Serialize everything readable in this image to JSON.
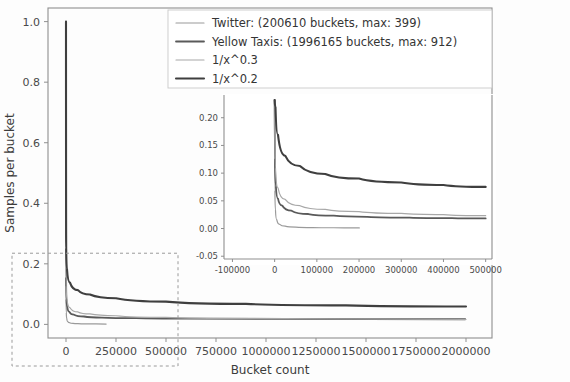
{
  "chart_data": {
    "type": "line",
    "title": "",
    "xlabel": "Bucket count",
    "ylabel": "Samples per bucket",
    "xlim": [
      -90000,
      2130000
    ],
    "ylim": [
      -0.045,
      1.045
    ],
    "grid": false,
    "legend_position": "upper center",
    "xticks": [
      0,
      250000,
      500000,
      750000,
      1000000,
      1250000,
      1500000,
      1750000,
      2000000
    ],
    "xticklabels": [
      "0",
      "250000",
      "500000",
      "750000",
      "1000000",
      "1250000",
      "1500000",
      "1750000",
      "2000000"
    ],
    "yticks": [
      0.0,
      0.2,
      0.4,
      0.6,
      0.8,
      1.0
    ],
    "yticklabels": [
      "0.0",
      "0.2",
      "0.4",
      "0.6",
      "0.8",
      "1.0"
    ],
    "series": [
      {
        "name": "Twitter: (200610 buckets, max: 399)",
        "color": "#9a9a9a",
        "width": 1.2,
        "x": [
          1,
          400,
          1500,
          4000,
          9000,
          18000,
          35000,
          60000,
          100000,
          150000,
          200610
        ],
        "y": [
          1.0,
          0.085,
          0.038,
          0.019,
          0.0095,
          0.0055,
          0.0035,
          0.0025,
          0.0018,
          0.0014,
          0.001
        ]
      },
      {
        "name": "Yellow Taxis: (1996165 buckets, max: 912)",
        "color": "#5a5a5a",
        "width": 1.8,
        "x": [
          1,
          500,
          2500,
          7000,
          16000,
          40000,
          90000,
          180000,
          350000,
          600000,
          1000000,
          1500000,
          1996165
        ],
        "y": [
          1.0,
          0.155,
          0.082,
          0.055,
          0.042,
          0.032,
          0.026,
          0.0225,
          0.0205,
          0.019,
          0.018,
          0.0175,
          0.017
        ]
      },
      {
        "name": "1/x^0.3",
        "color": "#a8a8a8",
        "width": 1.2,
        "x": [
          1,
          1000,
          5000,
          20000,
          60000,
          120000,
          250000,
          500000,
          900000,
          1400000,
          2000000
        ],
        "y": [
          1.0,
          0.126,
          0.082,
          0.055,
          0.041,
          0.0345,
          0.0285,
          0.0232,
          0.0198,
          0.0177,
          0.0161
        ]
      },
      {
        "name": "1/x^0.2",
        "color": "#3f3f3f",
        "width": 2.1,
        "x": [
          1,
          1000,
          5000,
          20000,
          60000,
          120000,
          250000,
          500000,
          900000,
          1400000,
          2000000
        ],
        "y": [
          1.0,
          0.251,
          0.182,
          0.138,
          0.113,
          0.0985,
          0.0862,
          0.0751,
          0.0676,
          0.0627,
          0.0589
        ]
      }
    ],
    "zoom_region_box": {
      "x0": -90000,
      "x1": 560000,
      "y0": -0.045,
      "y1": 0.235
    },
    "inset": {
      "type": "line",
      "xlim": [
        -120000,
        515000
      ],
      "ylim": [
        -0.055,
        0.232
      ],
      "xticks": [
        -100000,
        0,
        100000,
        200000,
        300000,
        400000,
        500000
      ],
      "xticklabels": [
        "-100000",
        "0",
        "100000",
        "200000",
        "300000",
        "400000",
        "500000"
      ],
      "yticks": [
        -0.05,
        0.0,
        0.05,
        0.1,
        0.15,
        0.2
      ],
      "yticklabels": [
        "-0.05",
        "0.00",
        "0.05",
        "0.10",
        "0.15",
        "0.20"
      ],
      "series": [
        {
          "name": "Twitter: (200610 buckets, max: 399)",
          "color": "#9a9a9a",
          "width": 1.2,
          "x": [
            1,
            600,
            2000,
            5000,
            12000,
            25000,
            50000,
            90000,
            140000,
            200610
          ],
          "y": [
            0.232,
            0.068,
            0.033,
            0.016,
            0.0075,
            0.0042,
            0.0026,
            0.0018,
            0.0014,
            0.0011
          ]
        },
        {
          "name": "Yellow Taxis: (1996165 buckets, max: 912)",
          "color": "#5a5a5a",
          "width": 1.8,
          "x": [
            1,
            700,
            3000,
            8000,
            18000,
            40000,
            80000,
            140000,
            220000,
            320000,
            420000,
            500000
          ],
          "y": [
            0.232,
            0.126,
            0.076,
            0.054,
            0.0415,
            0.0322,
            0.0262,
            0.0232,
            0.0212,
            0.0198,
            0.0188,
            0.0182
          ]
        },
        {
          "name": "1/x^0.3",
          "color": "#a8a8a8",
          "width": 1.2,
          "x": [
            1,
            2000,
            8000,
            25000,
            60000,
            120000,
            200000,
            300000,
            400000,
            500000
          ],
          "y": [
            0.232,
            0.109,
            0.0735,
            0.0525,
            0.0412,
            0.0345,
            0.0305,
            0.0272,
            0.0251,
            0.0232
          ]
        },
        {
          "name": "1/x^0.2",
          "color": "#3f3f3f",
          "width": 2.1,
          "x": [
            1,
            2000,
            8000,
            25000,
            60000,
            120000,
            200000,
            300000,
            400000,
            500000
          ],
          "y": [
            0.232,
            0.219,
            0.169,
            0.1315,
            0.1128,
            0.0985,
            0.0902,
            0.0832,
            0.0787,
            0.0751
          ]
        }
      ]
    }
  },
  "legend": {
    "entries": [
      {
        "label": "Twitter: (200610 buckets, max: 399)",
        "color": "#9a9a9a",
        "width": 1.2
      },
      {
        "label": "Yellow Taxis: (1996165 buckets, max: 912)",
        "color": "#5a5a5a",
        "width": 1.8
      },
      {
        "label": "1/x^0.3",
        "color": "#a8a8a8",
        "width": 1.2
      },
      {
        "label": "1/x^0.2",
        "color": "#3f3f3f",
        "width": 2.1
      }
    ]
  },
  "axes": {
    "xlabel": "Bucket count",
    "ylabel": "Samples per bucket"
  }
}
